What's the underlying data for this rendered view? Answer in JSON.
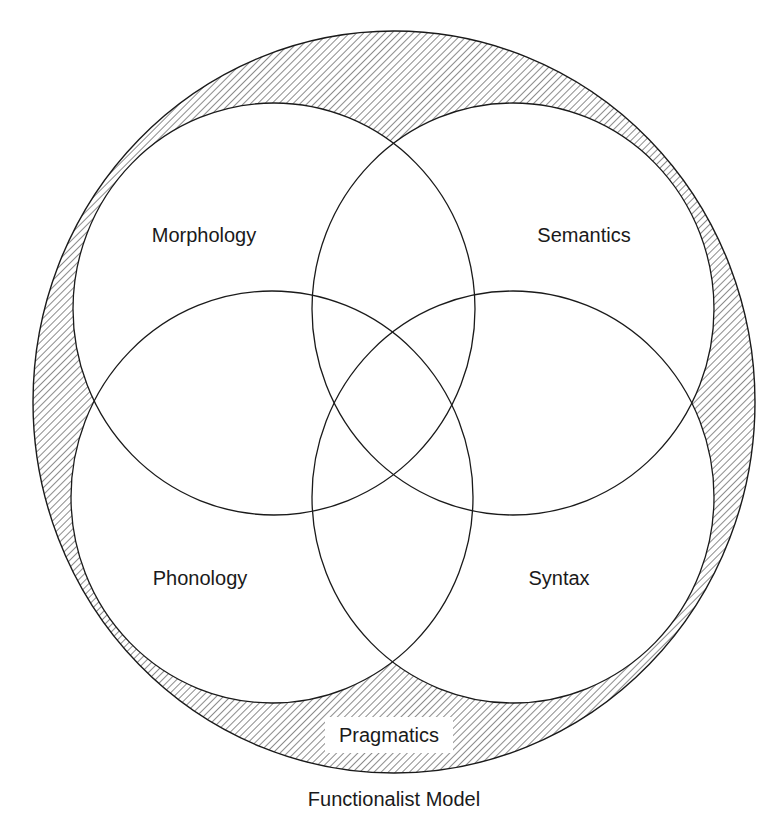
{
  "diagram": {
    "title": "Functionalist Model",
    "outer": {
      "label": "Pragmatics",
      "shape": {
        "cx": 394,
        "cy": 402,
        "rx": 361,
        "ry": 371
      },
      "fill": "hatched"
    },
    "circles": [
      {
        "label": "Morphology",
        "cx": 274,
        "cy": 309,
        "rx": 201,
        "ry": 206,
        "label_x": 204,
        "label_y": 242
      },
      {
        "label": "Semantics",
        "cx": 513,
        "cy": 309,
        "rx": 201,
        "ry": 206,
        "label_x": 584,
        "label_y": 242
      },
      {
        "label": "Phonology",
        "cx": 272,
        "cy": 497,
        "rx": 201,
        "ry": 206,
        "label_x": 200,
        "label_y": 585
      },
      {
        "label": "Syntax",
        "cx": 513,
        "cy": 497,
        "rx": 201,
        "ry": 206,
        "label_x": 559,
        "label_y": 585
      }
    ],
    "colors": {
      "stroke": "#1a1a1a",
      "hatch": "#6e6e6e",
      "background": "#ffffff"
    }
  }
}
